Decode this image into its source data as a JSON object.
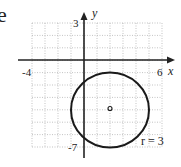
{
  "panel_label": "e",
  "chart_data": {
    "type": "scatter",
    "title": "",
    "xlabel": "x",
    "ylabel": "y",
    "xlim": [
      -4,
      6
    ],
    "ylim": [
      -7,
      3
    ],
    "grid": true,
    "tick_labels": {
      "x_min": "-4",
      "x_max": "6",
      "y_max": "3",
      "y_min": "-7"
    },
    "shapes": [
      {
        "kind": "circle",
        "center": [
          2,
          -4
        ],
        "radius": 3
      }
    ],
    "points": [
      {
        "x": 2,
        "y": -4,
        "marker": "open-circle",
        "label": "center"
      }
    ],
    "annotations": [
      {
        "text": "r = 3",
        "x": 5,
        "y": -6.5
      }
    ]
  }
}
